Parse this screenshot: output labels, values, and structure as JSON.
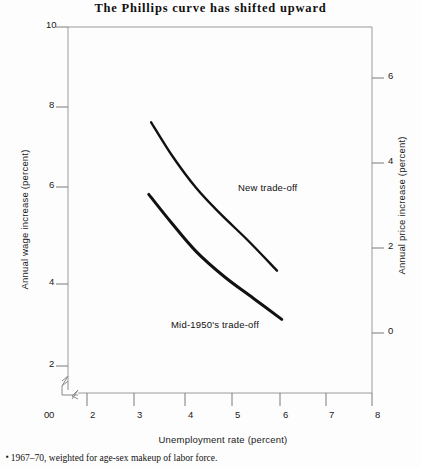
{
  "chart_data": {
    "type": "line",
    "title": "The Phillips curve has shifted upward",
    "xlabel": "Unemployment rate (percent)",
    "ylabel": "Annual wage increase (percent)",
    "y2label": "Annual price increase (percent)",
    "xlim": [
      0,
      8
    ],
    "ylim": [
      0,
      10
    ],
    "y2lim": [
      -2,
      7
    ],
    "grid": false,
    "legend": "inline-annotations",
    "xticks": [
      "0",
      "2",
      "3",
      "4",
      "5",
      "6",
      "7",
      "8"
    ],
    "yticks": [
      "0",
      "2",
      "4",
      "6",
      "8",
      "10"
    ],
    "y2ticks": [
      "0",
      "2",
      "4",
      "6"
    ],
    "axis_break": {
      "x_between": [
        "0",
        "2"
      ],
      "y_between": [
        "0",
        "2"
      ]
    },
    "series": [
      {
        "name": "New trade-off",
        "label": "New trade-off",
        "points": [
          {
            "x": 3.35,
            "y": 7.75
          },
          {
            "x": 3.8,
            "y": 6.95
          },
          {
            "x": 4.3,
            "y": 6.2
          },
          {
            "x": 4.8,
            "y": 5.6
          },
          {
            "x": 5.4,
            "y": 4.95
          },
          {
            "x": 6.0,
            "y": 4.25
          }
        ]
      },
      {
        "name": "Mid-1950's trade-off",
        "label": "Mid-1950's trade-off",
        "points": [
          {
            "x": 3.3,
            "y": 6.05
          },
          {
            "x": 3.8,
            "y": 5.35
          },
          {
            "x": 4.3,
            "y": 4.7
          },
          {
            "x": 4.9,
            "y": 4.1
          },
          {
            "x": 5.5,
            "y": 3.6
          },
          {
            "x": 6.1,
            "y": 3.1
          }
        ]
      }
    ],
    "footnote_marker": "▪",
    "footnote": "1967–70, weighted for age-sex makeup of labor force."
  },
  "colors": {
    "curve": "#111111",
    "axis": "#8a8a8a",
    "text": "#1a1a1a",
    "background": "#fdfdfd"
  }
}
